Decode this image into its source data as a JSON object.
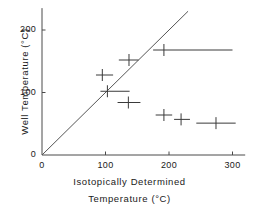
{
  "chart_data": {
    "type": "scatter",
    "title": "",
    "xlabel": "Isotopically  Determined Temperature (°C)",
    "xlabel_line1": "Isotopically  Determined",
    "xlabel_line2": "Temperature (°C)",
    "ylabel": "Well Temperature (°C)",
    "xlim": [
      0,
      320
    ],
    "ylim": [
      0,
      235
    ],
    "xticks": [
      0,
      100,
      200,
      300
    ],
    "xticklabels": [
      "0",
      "100",
      "200",
      "300"
    ],
    "yticks": [
      0,
      100,
      200
    ],
    "yticklabels": [
      "0",
      "100",
      "200"
    ],
    "grid": false,
    "legend": "none",
    "marker": "plus-with-horizontal-error-bar",
    "points": [
      {
        "x": 95,
        "y": 128,
        "xerr_low": 85,
        "xerr_high": 112
      },
      {
        "x": 103,
        "y": 102,
        "xerr_low": 92,
        "xerr_high": 138
      },
      {
        "x": 137,
        "y": 152,
        "xerr_low": 121,
        "xerr_high": 152
      },
      {
        "x": 136,
        "y": 84,
        "xerr_low": 119,
        "xerr_high": 155
      },
      {
        "x": 192,
        "y": 168,
        "xerr_low": 175,
        "xerr_high": 300
      },
      {
        "x": 192,
        "y": 64,
        "xerr_low": 179,
        "xerr_high": 205
      },
      {
        "x": 219,
        "y": 57,
        "xerr_low": 208,
        "xerr_high": 233
      },
      {
        "x": 274,
        "y": 51,
        "xerr_low": 243,
        "xerr_high": 305
      }
    ],
    "reference_line": {
      "name": "one-to-one-line",
      "from": [
        0,
        0
      ],
      "to": [
        230,
        230
      ],
      "slope": 1,
      "intercept": 0
    },
    "colors": {
      "axis": "#4a4a4a",
      "marker": "#3a3a3a",
      "line": "#555555",
      "background": "#ffffff"
    }
  }
}
